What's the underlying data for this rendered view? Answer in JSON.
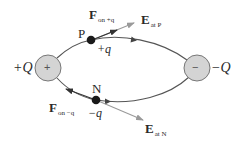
{
  "diagram": {
    "colors": {
      "background": "#ffffff",
      "field_line": "#555555",
      "charge_fill": "#d4d4d4",
      "charge_stroke": "#777777",
      "test_charge": "#1a1a1a",
      "field_vector": "#9a9a9a",
      "force_vector": "#333333",
      "text": "#2a2a2a"
    },
    "source_charges": [
      {
        "id": "positive",
        "symbol": "+",
        "label": "+Q"
      },
      {
        "id": "negative",
        "symbol": "−",
        "label": "−Q"
      }
    ],
    "points": [
      {
        "id": "P",
        "name": "P",
        "charge_label": "+q",
        "force_label": {
          "main": "F",
          "sub": "on +q"
        },
        "field_label": {
          "main": "E",
          "sub": "at P"
        }
      },
      {
        "id": "N",
        "name": "N",
        "charge_label": "−q",
        "force_label": {
          "main": "F",
          "sub": "on −q"
        },
        "field_label": {
          "main": "E",
          "sub": "at N"
        }
      }
    ]
  }
}
